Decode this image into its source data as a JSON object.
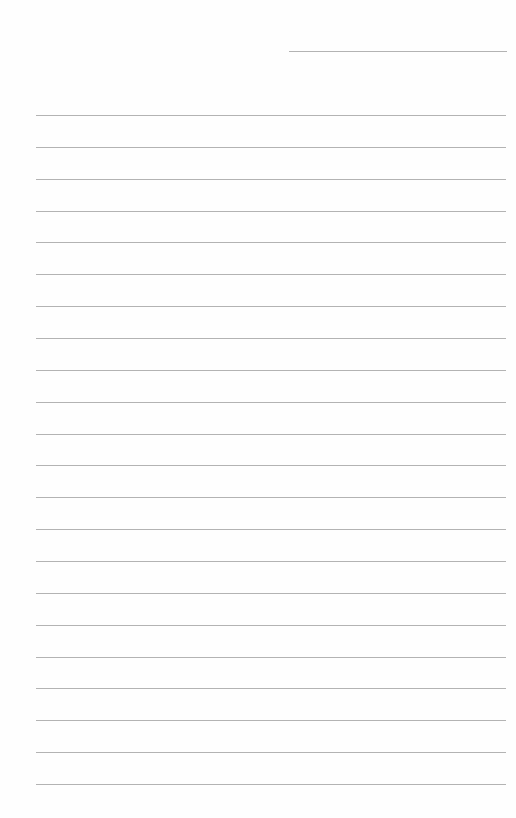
{
  "document": {
    "type": "blank lined paper",
    "header_line": {
      "y": 51,
      "x_start": 289,
      "x_end": 507
    },
    "ruled_lines": {
      "count": 22,
      "first_y": 115,
      "spacing": 31.86,
      "x_start": 36,
      "x_end": 506
    },
    "line_color": "#9a9a9a",
    "background_color": "#fefefe",
    "text_content": ""
  }
}
